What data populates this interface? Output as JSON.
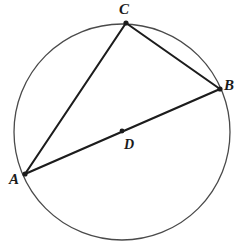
{
  "figure": {
    "canvas": {
      "width": 240,
      "height": 252,
      "background": "#ffffff"
    },
    "stroke_colors": {
      "circle": "#4a4a4a",
      "chord": "#1c1c1c",
      "point": "#1c1c1c",
      "label": "#1a1a1a"
    },
    "circle": {
      "name": "circle-outline",
      "center_x": 122,
      "center_y": 132,
      "radius": 108,
      "stroke_width": 1.3
    },
    "points": [
      {
        "id": "A",
        "label": "A",
        "x": 25,
        "y": 174,
        "label_x": 14,
        "label_y": 179,
        "dot": true,
        "dot_r": 2.6
      },
      {
        "id": "B",
        "label": "B",
        "x": 220,
        "y": 89,
        "label_x": 229,
        "label_y": 85,
        "dot": true,
        "dot_r": 2.6
      },
      {
        "id": "C",
        "label": "C",
        "x": 126,
        "y": 23,
        "label_x": 124,
        "label_y": 9,
        "dot": true,
        "dot_r": 2.6
      },
      {
        "id": "D",
        "label": "D",
        "x": 122,
        "y": 131,
        "label_x": 129,
        "label_y": 145,
        "dot": true,
        "dot_r": 2.4
      }
    ],
    "segments": [
      {
        "name": "segment-AC",
        "from": "A",
        "to": "C",
        "x1": 25,
        "y1": 174,
        "x2": 126,
        "y2": 23,
        "stroke_width": 2.1
      },
      {
        "name": "segment-CB",
        "from": "C",
        "to": "B",
        "x1": 126,
        "y1": 23,
        "x2": 220,
        "y2": 89,
        "stroke_width": 2.1
      },
      {
        "name": "segment-AB",
        "from": "A",
        "to": "B",
        "x1": 25,
        "y1": 174,
        "x2": 220,
        "y2": 89,
        "stroke_width": 2.3
      }
    ]
  }
}
